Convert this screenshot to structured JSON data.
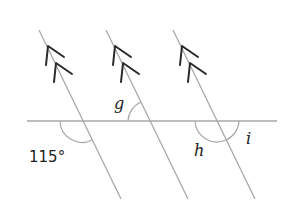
{
  "diagram": {
    "labels": {
      "given_angle": "115°",
      "angle_g": "g",
      "angle_h": "h",
      "angle_i": "i"
    },
    "parallel_marker": "double-arrow",
    "colors": {
      "line": "#a8a8a8",
      "arrow": "#2a2a2a",
      "text": "#222222"
    }
  }
}
